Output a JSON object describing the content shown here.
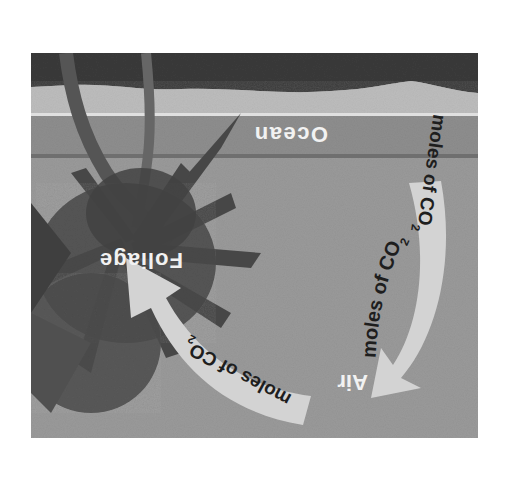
{
  "figure": {
    "orientation": "rotated 180°",
    "style": "grayscale photo illustration",
    "scene": "beach with palm trees, ocean horizon",
    "labels": {
      "ocean": "Ocean",
      "foliage": "Foliage",
      "air": "Air"
    },
    "arrows": [
      {
        "id": "ocean-to-air",
        "from": "Ocean",
        "to": "Air",
        "label_prefix": "moles of CO",
        "label_subscript": "2"
      },
      {
        "id": "air-to-foliage",
        "from": "Air",
        "to": "Foliage",
        "label_prefix": "moles of CO",
        "label_subscript": "2"
      }
    ],
    "colors": {
      "sky_dark": "#3a3a3a",
      "sand": "#bdbdbd",
      "ocean_band": "#8e8e8e",
      "ocean_line": "#6f6f6f",
      "water": "#9a9a9a",
      "arrow_fill": "#d3d3d3",
      "label_light": "#f2f2f2",
      "label_dark": "#1e1e1e",
      "foliage": "#4a4a4a"
    }
  }
}
